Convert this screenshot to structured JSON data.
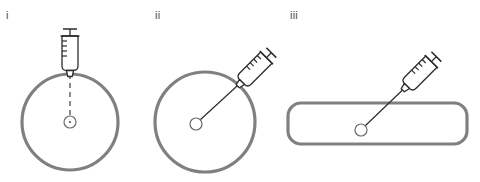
{
  "figure": {
    "width": 480,
    "height": 182,
    "background": "#ffffff"
  },
  "style": {
    "body_outline_color": "#808080",
    "body_outline_width": 3.2,
    "syringe_color": "#2b2b2b",
    "syringe_line_width": 1.3,
    "needle_color": "#2b2b2b",
    "needle_width": 1.2,
    "target_color": "#4d4d4d",
    "target_width": 1.2,
    "label_color": "#4d4d4d",
    "dash_pattern": "5 4"
  },
  "panels": [
    {
      "id": "i",
      "label": "i",
      "label_x": 6,
      "label_y": 10,
      "body": {
        "shape": "circle",
        "cx": 70,
        "cy": 122,
        "r": 48
      },
      "target": {
        "cx": 70,
        "cy": 122,
        "r": 6,
        "has_center_dot": true
      },
      "syringe": {
        "angle_deg": 0,
        "tip_x": 70,
        "tip_y": 62,
        "body_length": 44,
        "body_width": 16,
        "graduations": 4
      },
      "needle": {
        "x1": 70,
        "y1": 62,
        "x2": 70,
        "y2": 74,
        "dashed": false
      },
      "internal_path": {
        "x1": 70,
        "y1": 74,
        "x2": 70,
        "y2": 116,
        "dashed": true
      }
    },
    {
      "id": "ii",
      "label": "ii",
      "label_x": 155,
      "label_y": 10,
      "body": {
        "shape": "circle",
        "cx": 205,
        "cy": 122,
        "r": 50
      },
      "target": {
        "cx": 196,
        "cy": 124,
        "r": 6,
        "has_center_dot": false
      },
      "syringe": {
        "angle_deg": -45,
        "tip_x": 248,
        "tip_y": 76,
        "body_length": 44,
        "body_width": 16,
        "graduations": 4
      },
      "needle": {
        "x1": 248,
        "y1": 76,
        "x2": 200,
        "y2": 120,
        "dashed": false
      },
      "internal_path": null
    },
    {
      "id": "iii",
      "label": "iii",
      "label_x": 290,
      "label_y": 10,
      "body": {
        "shape": "rounded-rect",
        "x": 288,
        "y": 103,
        "width": 179,
        "height": 41,
        "rx": 13
      },
      "target": {
        "cx": 361,
        "cy": 130,
        "r": 6,
        "has_center_dot": false
      },
      "syringe": {
        "angle_deg": -45,
        "tip_x": 413,
        "tip_y": 80,
        "body_length": 44,
        "body_width": 16,
        "graduations": 4
      },
      "needle": {
        "x1": 413,
        "y1": 80,
        "x2": 365,
        "y2": 126,
        "dashed": false
      },
      "internal_path": null
    }
  ]
}
